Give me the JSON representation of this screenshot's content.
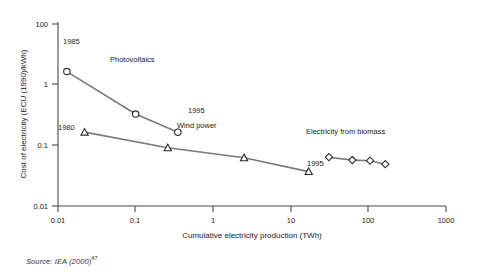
{
  "figure": {
    "source_note_prefix": "Source: IEA (2000)",
    "source_note_superscript": "47"
  },
  "chart_data": {
    "type": "line",
    "title": "",
    "subtitle": "",
    "xlabel": "Cumulative electricity production (TWh)",
    "ylabel": "Cost of electricity (ECU (1990)/kWh)",
    "xscale": "log",
    "yscale": "log",
    "xlim": [
      0.01,
      1000
    ],
    "ylim": [
      0.01,
      100
    ],
    "grid": false,
    "legend_position": "inline-annotations",
    "xticks": [
      "0.01",
      "0.1",
      "1",
      "10",
      "100",
      "1000"
    ],
    "xtick_values": [
      0.01,
      0.1,
      1,
      10,
      100,
      1000
    ],
    "yticks": [
      "100",
      "1",
      "0.1",
      "0.01"
    ],
    "ytick_values": [
      100,
      1,
      0.1,
      0.01
    ],
    "series": [
      {
        "name": "Photovoltaics",
        "marker": "circle",
        "x": [
          0.013,
          0.1,
          0.35
        ],
        "y": [
          9.0,
          1.05,
          0.42
        ]
      },
      {
        "name": "Wind power",
        "marker": "triangle",
        "x": [
          0.022,
          0.26,
          2.5,
          17.0
        ],
        "y": [
          0.42,
          0.19,
          0.115,
          0.057
        ]
      },
      {
        "name": "Electricity from biomass",
        "marker": "diamond",
        "x": [
          31.0,
          62.0,
          105.0,
          165.0
        ],
        "y": [
          0.118,
          0.102,
          0.099,
          0.083
        ]
      }
    ],
    "annotations": [
      {
        "text": "1985",
        "series": "Photovoltaics",
        "x": 0.013,
        "y": 9.0,
        "placement": "above-left"
      },
      {
        "text": "Photovoltaics",
        "series": "Photovoltaics",
        "x": 0.055,
        "y": 2.6,
        "placement": "series-label"
      },
      {
        "text": "1995",
        "series": "Photovoltaics",
        "x": 0.35,
        "y": 0.42,
        "placement": "right"
      },
      {
        "text": "1980",
        "series": "Wind power",
        "x": 0.022,
        "y": 0.42,
        "placement": "below-left"
      },
      {
        "text": "Wind power",
        "series": "Wind power",
        "x": 0.55,
        "y": 0.2,
        "placement": "series-label"
      },
      {
        "text": "1995",
        "series": "Wind power",
        "x": 17.0,
        "y": 0.057,
        "placement": "right"
      },
      {
        "text": "Electricity from biomass",
        "series": "Electricity from biomass",
        "x": 60.0,
        "y": 0.17,
        "placement": "series-label"
      }
    ]
  }
}
